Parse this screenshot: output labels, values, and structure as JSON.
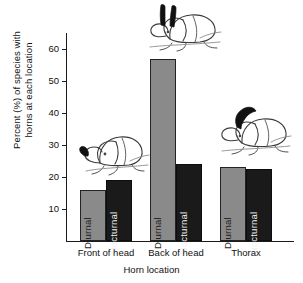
{
  "chart_data": {
    "type": "bar",
    "title": "",
    "xlabel": "Horn location",
    "ylabel": "Percent (%) of species with\nhorns at each location",
    "categories": [
      "Front of head",
      "Back of head",
      "Thorax"
    ],
    "series": [
      {
        "name": "Diurnal",
        "values": [
          16,
          57,
          23
        ],
        "color": "#8a8a8a"
      },
      {
        "name": "Nocturnal",
        "values": [
          19,
          24,
          22.5
        ],
        "color": "#1a1a1a"
      }
    ],
    "ylim": [
      0,
      65
    ],
    "yticks": [
      10,
      20,
      30,
      40,
      50,
      60
    ],
    "ytick_labels": [
      "10",
      "20",
      "30",
      "40",
      "50",
      "60"
    ],
    "grid": false,
    "legend": "in-bar labels",
    "annotations": [
      {
        "name": "beetle-front-of-head",
        "description": "line drawing of beetle with single black horn on front of head"
      },
      {
        "name": "beetle-back-of-head",
        "description": "line drawing of beetle with two black horns on back of head"
      },
      {
        "name": "beetle-thorax",
        "description": "line drawing of beetle with curved black horn on thorax"
      }
    ]
  },
  "axes": {
    "y_label_line1": "Percent (%) of species with",
    "y_label_line2": "horns at each location",
    "x_label": "Horn location",
    "ticks": [
      "60",
      "50",
      "40",
      "30",
      "20",
      "10"
    ]
  },
  "groups": [
    {
      "caption": "Front of head",
      "diurnal_label": "Diurnal",
      "nocturnal_label": "Nocturnal"
    },
    {
      "caption": "Back of head",
      "diurnal_label": "Diurnal",
      "nocturnal_label": "Nocturnal"
    },
    {
      "caption": "Thorax",
      "diurnal_label": "Diurnal",
      "nocturnal_label": "Nocturnal"
    }
  ]
}
